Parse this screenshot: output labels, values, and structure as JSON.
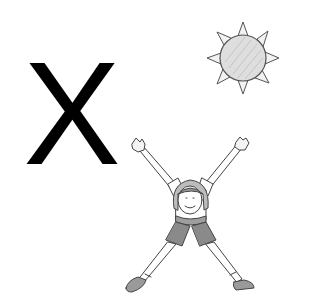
{
  "letter": {
    "text": "X",
    "color": "#000000"
  },
  "illustrations": {
    "sun": {
      "label": "sun",
      "ray_count": 8,
      "fill": "#d9d9d9",
      "stroke": "#555555"
    },
    "figure": {
      "label": "girl doing a star jump in an X shape",
      "shirt_color": "#ffffff",
      "shorts_color": "#8a8a8a",
      "stroke": "#444444"
    }
  },
  "colors": {
    "background": "#ffffff",
    "ink": "#000000",
    "sketch": "#444444"
  }
}
